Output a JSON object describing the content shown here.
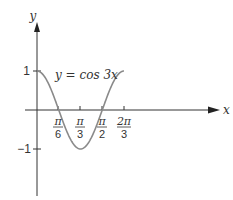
{
  "chart_data": {
    "type": "line",
    "title": "",
    "xlabel": "x",
    "ylabel": "y",
    "annotation": "y = cos 3x",
    "series": [
      {
        "name": "y = cos 3x",
        "function": "cos(3x)",
        "x_range": [
          0,
          2.0944
        ],
        "color": "#8a8a8a"
      }
    ],
    "x_ticks": [
      {
        "value": 0.5236,
        "num": "π",
        "den": "6"
      },
      {
        "value": 1.0472,
        "num": "π",
        "den": "3"
      },
      {
        "value": 1.5708,
        "num": "π",
        "den": "2"
      },
      {
        "value": 2.0944,
        "num": "2π",
        "den": "3"
      }
    ],
    "y_ticks": [
      {
        "value": 1,
        "label": "1"
      },
      {
        "value": -1,
        "label": "−1"
      }
    ],
    "xlim": [
      0,
      3.6
    ],
    "ylim": [
      -1.4,
      1.6
    ],
    "grid": false,
    "legend": "none"
  },
  "labels": {
    "x_axis": "x",
    "y_axis": "y",
    "curve": "y = cos 3x",
    "y_one": "1",
    "y_neg_one": "−1",
    "t1_num": "π",
    "t1_den": "6",
    "t2_num": "π",
    "t2_den": "3",
    "t3_num": "π",
    "t3_den": "2",
    "t4_num": "2π",
    "t4_den": "3"
  }
}
